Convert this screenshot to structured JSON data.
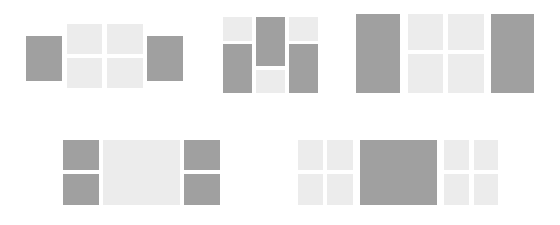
{
  "colors": {
    "background": "#ffffff",
    "dark_tile": "#a0a0a0",
    "light_tile": "#ececec"
  },
  "layouts": [
    {
      "name": "layout-1",
      "tiles": [
        {
          "tone": "dark",
          "x": 26,
          "y": 36,
          "w": 36,
          "h": 45
        },
        {
          "tone": "light",
          "x": 67,
          "y": 24,
          "w": 35,
          "h": 30
        },
        {
          "tone": "light",
          "x": 107,
          "y": 24,
          "w": 36,
          "h": 30
        },
        {
          "tone": "light",
          "x": 67,
          "y": 58,
          "w": 35,
          "h": 30
        },
        {
          "tone": "light",
          "x": 107,
          "y": 58,
          "w": 36,
          "h": 30
        },
        {
          "tone": "dark",
          "x": 147,
          "y": 36,
          "w": 36,
          "h": 45
        }
      ]
    },
    {
      "name": "layout-2",
      "tiles": [
        {
          "tone": "light",
          "x": 223,
          "y": 17,
          "w": 29,
          "h": 24
        },
        {
          "tone": "dark",
          "x": 223,
          "y": 44,
          "w": 29,
          "h": 49
        },
        {
          "tone": "dark",
          "x": 256,
          "y": 17,
          "w": 29,
          "h": 49
        },
        {
          "tone": "light",
          "x": 256,
          "y": 70,
          "w": 29,
          "h": 23
        },
        {
          "tone": "light",
          "x": 289,
          "y": 17,
          "w": 29,
          "h": 24
        },
        {
          "tone": "dark",
          "x": 289,
          "y": 44,
          "w": 29,
          "h": 49
        }
      ]
    },
    {
      "name": "layout-3",
      "tiles": [
        {
          "tone": "dark",
          "x": 356,
          "y": 14,
          "w": 44,
          "h": 79
        },
        {
          "tone": "light",
          "x": 408,
          "y": 14,
          "w": 35,
          "h": 36
        },
        {
          "tone": "light",
          "x": 448,
          "y": 14,
          "w": 36,
          "h": 36
        },
        {
          "tone": "light",
          "x": 408,
          "y": 54,
          "w": 35,
          "h": 39
        },
        {
          "tone": "light",
          "x": 448,
          "y": 54,
          "w": 36,
          "h": 39
        },
        {
          "tone": "dark",
          "x": 491,
          "y": 14,
          "w": 43,
          "h": 79
        }
      ]
    },
    {
      "name": "layout-4",
      "tiles": [
        {
          "tone": "dark",
          "x": 63,
          "y": 140,
          "w": 36,
          "h": 30
        },
        {
          "tone": "dark",
          "x": 63,
          "y": 174,
          "w": 36,
          "h": 31
        },
        {
          "tone": "light",
          "x": 103,
          "y": 140,
          "w": 77,
          "h": 65
        },
        {
          "tone": "dark",
          "x": 184,
          "y": 140,
          "w": 36,
          "h": 30
        },
        {
          "tone": "dark",
          "x": 184,
          "y": 174,
          "w": 36,
          "h": 31
        }
      ]
    },
    {
      "name": "layout-5",
      "tiles": [
        {
          "tone": "light",
          "x": 298,
          "y": 140,
          "w": 25,
          "h": 30
        },
        {
          "tone": "light",
          "x": 327,
          "y": 140,
          "w": 26,
          "h": 30
        },
        {
          "tone": "light",
          "x": 298,
          "y": 174,
          "w": 25,
          "h": 31
        },
        {
          "tone": "light",
          "x": 327,
          "y": 174,
          "w": 26,
          "h": 31
        },
        {
          "tone": "dark",
          "x": 360,
          "y": 140,
          "w": 77,
          "h": 65
        },
        {
          "tone": "light",
          "x": 444,
          "y": 140,
          "w": 25,
          "h": 30
        },
        {
          "tone": "light",
          "x": 474,
          "y": 140,
          "w": 24,
          "h": 30
        },
        {
          "tone": "light",
          "x": 444,
          "y": 174,
          "w": 25,
          "h": 31
        },
        {
          "tone": "light",
          "x": 474,
          "y": 174,
          "w": 24,
          "h": 31
        }
      ]
    }
  ]
}
